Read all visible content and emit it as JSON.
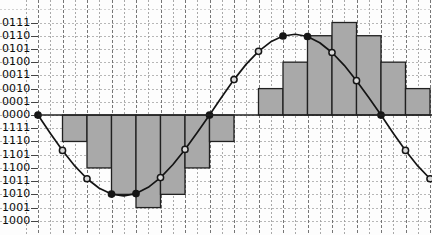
{
  "chart_data": {
    "type": "bar",
    "title": "",
    "subtitle": "",
    "xlabel": "",
    "ylabel": "",
    "grid": true,
    "legend": false,
    "y_tick_labels": [
      "0111",
      "0110",
      "0101",
      "0100",
      "0011",
      "0010",
      "0001",
      "0000",
      "1111",
      "1110",
      "1101",
      "1100",
      "1011",
      "1010",
      "1001",
      "1000"
    ],
    "y_levels": [
      7,
      6,
      5,
      4,
      3,
      2,
      1,
      0,
      -1,
      -2,
      -3,
      -4,
      -5,
      -6,
      -7,
      -8
    ],
    "ylim": [
      -8,
      7
    ],
    "xlim": [
      0,
      16
    ],
    "n_samples": 16,
    "categories": [
      "0",
      "1",
      "2",
      "3",
      "4",
      "5",
      "6",
      "7",
      "8",
      "9",
      "10",
      "11",
      "12",
      "13",
      "14",
      "15"
    ],
    "values": [
      0,
      -2,
      -4,
      -6,
      -7,
      -6,
      -4,
      -2,
      0,
      2,
      4,
      6,
      7,
      6,
      4,
      2
    ],
    "curve_points_x": [
      0,
      0.5,
      1,
      1.5,
      2,
      2.5,
      3,
      3.5,
      4,
      4.5,
      5,
      5.5,
      6,
      6.5,
      7,
      7.5,
      8,
      8.5,
      9,
      9.5,
      10,
      10.5,
      11,
      11.5,
      12,
      12.5,
      13,
      13.5,
      14,
      14.5,
      15,
      15.5,
      16
    ],
    "curve_points_y": [
      0,
      -1.37,
      -2.68,
      -3.85,
      -4.82,
      -5.54,
      -5.98,
      -6.11,
      -5.94,
      -5.47,
      -4.73,
      -3.76,
      -2.6,
      -1.32,
      0,
      1.37,
      2.68,
      3.85,
      4.82,
      5.54,
      5.98,
      6.11,
      5.94,
      5.47,
      4.73,
      3.76,
      2.6,
      1.32,
      0,
      -1.37,
      -2.68,
      -3.85,
      -4.82
    ],
    "marker_samples_x": [
      0,
      1,
      2,
      3,
      4,
      5,
      6,
      7,
      8,
      9,
      10,
      11,
      12,
      13,
      14,
      15,
      16
    ],
    "marker_samples_y": [
      0,
      -2.68,
      -4.82,
      -5.98,
      -5.94,
      -4.73,
      -2.6,
      0,
      2.68,
      4.82,
      5.98,
      5.94,
      4.73,
      2.6,
      0,
      -2.68,
      -4.82
    ],
    "series": [
      {
        "name": "quantized-staircase",
        "type": "bar",
        "values": [
          0,
          -2,
          -4,
          -6,
          -7,
          -6,
          -4,
          -2,
          0,
          2,
          4,
          6,
          7,
          6,
          4,
          2
        ]
      },
      {
        "name": "sine-wave",
        "type": "line"
      }
    ],
    "colors": {
      "bar_fill": "#a9a9a9",
      "bar_stroke": "#202020",
      "curve": "#141414",
      "marker_fill": "#161616",
      "grid": "#a6a6a6",
      "axis_text": "#0b0b0b",
      "background": "#fdfdfd"
    }
  }
}
